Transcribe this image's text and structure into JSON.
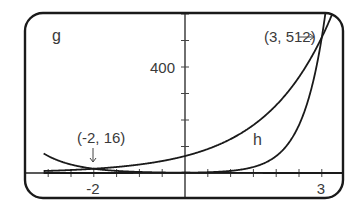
{
  "chart_data": {
    "type": "line",
    "title": "",
    "xlabel": "",
    "ylabel": "",
    "xlim": [
      -3.05,
      3.45
    ],
    "ylim": [
      -95,
      600
    ],
    "x_tick_step": 0.5,
    "y_tick_step": 100,
    "x_tick_labels": [
      {
        "value": -2,
        "label": "-2"
      },
      {
        "value": 3,
        "label": "3"
      }
    ],
    "y_tick_labels": [
      {
        "value": 400,
        "label": "400"
      }
    ],
    "grid": false,
    "legend": null,
    "series": [
      {
        "name": "g",
        "description": "decreasing exponential, steep near left, passes (-2, 16)",
        "formula": "(1/4)^x",
        "points": [
          [
            -3,
            64
          ],
          [
            -2.5,
            32
          ],
          [
            -2,
            16
          ],
          [
            -1,
            4
          ],
          [
            0,
            1
          ],
          [
            1,
            0.25
          ],
          [
            3,
            0.02
          ]
        ]
      },
      {
        "name": "h",
        "description": "increasing exponential, passes (3, 512)",
        "formula": "64*2^x",
        "points": [
          [
            -3,
            8
          ],
          [
            -2,
            16
          ],
          [
            -1,
            32
          ],
          [
            0,
            64
          ],
          [
            1,
            128
          ],
          [
            2,
            256
          ],
          [
            3,
            512
          ]
        ]
      },
      {
        "name": "unlabeled",
        "description": "steep increasing exponential, passes (3, 512)",
        "formula": "8^x",
        "points": [
          [
            0,
            1
          ],
          [
            1,
            8
          ],
          [
            2,
            64
          ],
          [
            2.5,
            181
          ],
          [
            3,
            512
          ]
        ]
      }
    ],
    "annotations": [
      {
        "text": "(-2, 16)",
        "point": [
          -2,
          16
        ],
        "arrow": "down"
      },
      {
        "text": "(3, 512)",
        "point": [
          3,
          512
        ],
        "arrow": "right"
      },
      {
        "text": "g",
        "target": "g"
      },
      {
        "text": "h",
        "target": "h"
      }
    ]
  },
  "labels": {
    "g": "g",
    "h": "h",
    "y400": "400",
    "xneg2": "-2",
    "x3": "3",
    "pt1": "(-2, 16)",
    "pt2": "(3, 512)"
  }
}
